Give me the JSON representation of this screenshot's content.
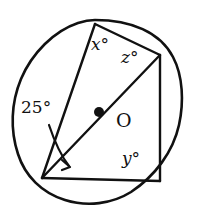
{
  "figure": {
    "kind": "circle-geometry-diagram",
    "width": 197,
    "height": 214,
    "background_color": "#ffffff",
    "stroke_color": "#111111",
    "circle": {
      "center_label": "O",
      "center_x": 99,
      "center_y": 112,
      "radius": 92
    },
    "points": [
      {
        "id": "T",
        "role": "top-vertex",
        "x": 95,
        "y": 24
      },
      {
        "id": "R",
        "role": "right-vertex",
        "x": 160,
        "y": 55
      },
      {
        "id": "L",
        "role": "bottom-left-vertex",
        "x": 42,
        "y": 178
      },
      {
        "id": "B",
        "role": "bottom-right-vertex",
        "x": 160,
        "y": 181
      },
      {
        "id": "O",
        "role": "center",
        "x": 99,
        "y": 112
      }
    ],
    "segments": [
      {
        "id": "chord-top",
        "from": "T",
        "to": "R"
      },
      {
        "id": "chord-right",
        "from": "R",
        "to": "B"
      },
      {
        "id": "chord-bottom",
        "from": "B",
        "to": "L"
      },
      {
        "id": "chord-left",
        "from": "L",
        "to": "T"
      },
      {
        "id": "diameter-LR",
        "from": "L",
        "to": "R",
        "through_center": true
      }
    ],
    "labels": {
      "angle_x": "x°",
      "angle_z": "z°",
      "angle_y": "y°",
      "angle_25": "25°",
      "center": "O"
    },
    "angle_markers": [
      {
        "name": "x",
        "text": "x°",
        "at_vertex": "T",
        "between": [
          "chord-left",
          "chord-top"
        ],
        "x": 91,
        "y": 36
      },
      {
        "name": "z",
        "text": "z°",
        "at_vertex": "R",
        "between": [
          "chord-top",
          "diameter-LR"
        ],
        "x": 121,
        "y": 49
      },
      {
        "name": "y",
        "text": "y°",
        "at_vertex": "B",
        "between": [
          "chord-right",
          "chord-bottom"
        ],
        "x": 122,
        "y": 150
      },
      {
        "name": "25",
        "text": "25°",
        "at_vertex": "L",
        "between": [
          "chord-left",
          "diameter-LR"
        ],
        "x": 21,
        "y": 99,
        "has_pointer_arrow": true
      }
    ],
    "arrow": {
      "name": "angle-25-pointer",
      "description": "curved arrow from the 25 degree label down to the angle at the lower-left vertex",
      "path": "M 49 125 C 56 146 62 157 69 166",
      "tip_x": 69,
      "tip_y": 166
    }
  }
}
